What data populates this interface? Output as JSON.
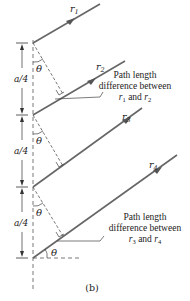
{
  "figure": {
    "caption": "(b)",
    "rays": [
      {
        "label": "r",
        "sub": "1"
      },
      {
        "label": "r",
        "sub": "2"
      },
      {
        "label": "r",
        "sub": "3"
      },
      {
        "label": "r",
        "sub": "4"
      }
    ],
    "spacing_labels": [
      "a/4",
      "a/4",
      "a/4"
    ],
    "angle_label": "θ",
    "annotations": [
      {
        "line1": "Path length",
        "line2": "difference between",
        "line3_a": "r",
        "line3_a_sub": "1",
        "line3_mid": " and ",
        "line3_b": "r",
        "line3_b_sub": "2"
      },
      {
        "line1": "Path length",
        "line2": "difference between",
        "line3_a": "r",
        "line3_a_sub": "3",
        "line3_mid": " and ",
        "line3_b": "r",
        "line3_b_sub": "4"
      }
    ],
    "colors": {
      "ray": "#666666",
      "dash": "#555555",
      "text": "#222222"
    }
  }
}
